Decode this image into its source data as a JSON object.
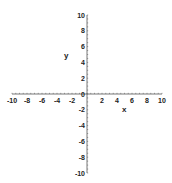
{
  "chart_data": {
    "type": "line",
    "title": "",
    "xlabel": "x",
    "ylabel": "y",
    "xlim": [
      -10,
      10
    ],
    "ylim": [
      -10,
      10
    ],
    "grid": false,
    "legend": null,
    "series": [],
    "x_ticks": [
      -10,
      -8,
      -6,
      -4,
      -2,
      0,
      2,
      4,
      6,
      8,
      10
    ],
    "x_tick_labels": [
      "-10",
      "-8",
      "-6",
      "-4",
      "-2",
      "",
      "2",
      "4",
      "6",
      "8",
      "10"
    ],
    "y_ticks": [
      -10,
      -8,
      -6,
      -4,
      -2,
      0,
      2,
      4,
      6,
      8,
      10
    ],
    "y_tick_labels": [
      "-10",
      "-8",
      "-6",
      "-4",
      "-2",
      "0",
      "2",
      "4",
      "6",
      "8",
      "10"
    ],
    "axis_color": "#555555",
    "text_color": "#222222"
  }
}
